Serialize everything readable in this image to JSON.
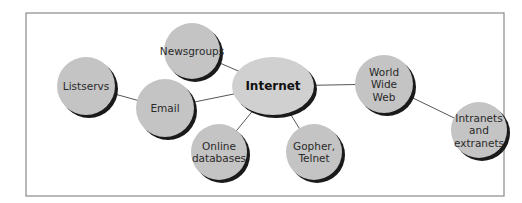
{
  "diagram": {
    "title": "",
    "colors": {
      "background": "#ffffff",
      "frame": "#8a8a8a",
      "node_fill": "#c4c4c4",
      "center_fill": "#d0d0d0",
      "shadow": "#1a1a1a",
      "edge": "#555555",
      "text": "#2a2a2a"
    },
    "frame": {
      "x": 26,
      "y": 13,
      "w": 478,
      "h": 183
    },
    "center": {
      "id": "internet",
      "label": "Internet",
      "cx": 273,
      "cy": 86,
      "rx": 41,
      "ry": 29
    },
    "nodes": [
      {
        "id": "newsgroups",
        "lines": [
          "Newsgroups"
        ],
        "cx": 192,
        "cy": 51,
        "r": 28
      },
      {
        "id": "listservs",
        "lines": [
          "Listservs"
        ],
        "cx": 86,
        "cy": 86,
        "r": 29
      },
      {
        "id": "email",
        "lines": [
          "Email"
        ],
        "cx": 165,
        "cy": 108,
        "r": 29
      },
      {
        "id": "online-databases",
        "lines": [
          "Online",
          "databases"
        ],
        "cx": 219,
        "cy": 152,
        "r": 28
      },
      {
        "id": "gopher-telnet",
        "lines": [
          "Gopher,",
          "Telnet"
        ],
        "cx": 314,
        "cy": 152,
        "r": 28
      },
      {
        "id": "world-wide-web",
        "lines": [
          "World",
          "Wide",
          "Web"
        ],
        "cx": 384,
        "cy": 84,
        "r": 29
      },
      {
        "id": "intranets-extranets",
        "lines": [
          "Intranets",
          "and",
          "extranets"
        ],
        "cx": 479,
        "cy": 130,
        "r": 28
      }
    ],
    "edges": [
      {
        "from": "listservs",
        "to": "email"
      },
      {
        "from": "email",
        "to": "internet"
      },
      {
        "from": "newsgroups",
        "to": "internet"
      },
      {
        "from": "online-databases",
        "to": "internet"
      },
      {
        "from": "gopher-telnet",
        "to": "internet"
      },
      {
        "from": "internet",
        "to": "world-wide-web"
      },
      {
        "from": "world-wide-web",
        "to": "intranets-extranets"
      }
    ]
  }
}
